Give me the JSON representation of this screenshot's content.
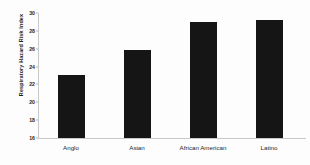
{
  "chart_data": {
    "type": "bar",
    "title": "",
    "xlabel": "",
    "ylabel": "Respiratory Hazard Risk Index",
    "categories": [
      "Anglo",
      "Asian",
      "African American",
      "Latino"
    ],
    "values": [
      23.1,
      25.9,
      29.0,
      29.2
    ],
    "ylim": [
      16,
      30
    ],
    "yticks": [
      16,
      18,
      20,
      22,
      24,
      26,
      28,
      30
    ],
    "ytick_labels": [
      "16",
      "18",
      "20",
      "22",
      "24",
      "26",
      "28",
      "30"
    ],
    "grid": false,
    "legend": null,
    "bar_color": "#151515",
    "axis_color": "#c9c9c9",
    "background_color": "#fdfdfd"
  }
}
